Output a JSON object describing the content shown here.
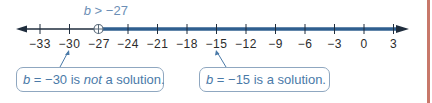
{
  "inequality": {
    "var": "b",
    "op": " > ",
    "value": "−27"
  },
  "number_line": {
    "min": -33,
    "max": 3,
    "step": 3,
    "ticks": [
      "−33",
      "−30",
      "−27",
      "−24",
      "−21",
      "−18",
      "−15",
      "−12",
      "−9",
      "−6",
      "−3",
      "0",
      "3"
    ],
    "open_circle_at": -27,
    "shaded_direction": "right",
    "colors": {
      "axis": "#1f2d3d",
      "shade": "#2f5f8f",
      "circle": "#5a6a7a"
    }
  },
  "callouts": [
    {
      "var": "b",
      "eq": " = −30 is ",
      "emph": "not",
      "rest": " a solution.",
      "points_to": -30
    },
    {
      "var": "b",
      "eq": " = −15 is a solution.",
      "emph": "",
      "rest": "",
      "points_to": -15
    }
  ],
  "colors": {
    "callout_border": "#8fa7c0",
    "callout_text": "#4a7aa8",
    "inequality_text": "#6c8fb6",
    "side_border": "#c8786a"
  }
}
